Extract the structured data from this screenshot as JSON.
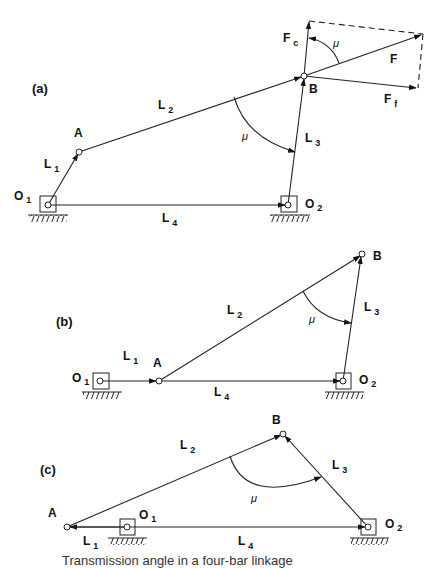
{
  "figure": {
    "panels": [
      {
        "id": "a",
        "label": "(a)",
        "joints": {
          "O1": "O",
          "O1_sub": "1",
          "A": "A",
          "B": "B",
          "O2": "O",
          "O2_sub": "2"
        },
        "links": [
          {
            "name": "L",
            "sub": "1"
          },
          {
            "name": "L",
            "sub": "2"
          },
          {
            "name": "L",
            "sub": "3"
          },
          {
            "name": "L",
            "sub": "4"
          }
        ],
        "angle_label": "μ",
        "angle_label_force": "μ",
        "forces": {
          "F": "F",
          "Fc": "F",
          "Fc_sub": "c",
          "Ff": "F",
          "Ff_sub": "f"
        }
      },
      {
        "id": "b",
        "label": "(b)",
        "joints": {
          "O1": "O",
          "O1_sub": "1",
          "A": "A",
          "B": "B",
          "O2": "O",
          "O2_sub": "2"
        },
        "links": [
          {
            "name": "L",
            "sub": "1"
          },
          {
            "name": "L",
            "sub": "2"
          },
          {
            "name": "L",
            "sub": "3"
          },
          {
            "name": "L",
            "sub": "4"
          }
        ],
        "angle_label": "μ"
      },
      {
        "id": "c",
        "label": "(c)",
        "joints": {
          "O1": "O",
          "O1_sub": "1",
          "A": "A",
          "B": "B",
          "O2": "O",
          "O2_sub": "2"
        },
        "links": [
          {
            "name": "L",
            "sub": "1"
          },
          {
            "name": "L",
            "sub": "2"
          },
          {
            "name": "L",
            "sub": "3"
          },
          {
            "name": "L",
            "sub": "4"
          }
        ],
        "angle_label": "μ"
      }
    ],
    "caption_partial": "Transmission angle in a four-bar linkage"
  }
}
